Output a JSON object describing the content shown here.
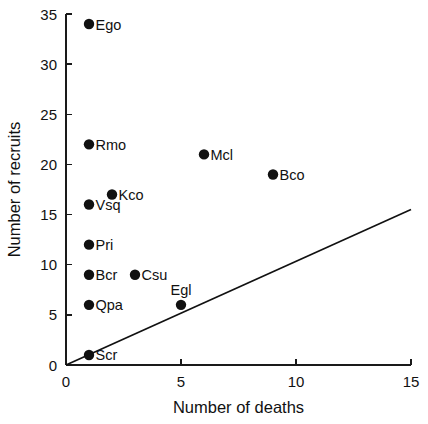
{
  "chart_data": {
    "type": "scatter",
    "title": "",
    "xlabel": "Number of deaths",
    "ylabel": "Number of recruits",
    "xlim": [
      0,
      15
    ],
    "ylim": [
      0,
      35
    ],
    "xticks": [
      0,
      5,
      10,
      15
    ],
    "yticks": [
      0,
      5,
      10,
      15,
      20,
      25,
      30,
      35
    ],
    "xtick_labels": [
      "0",
      "5",
      "10",
      "15"
    ],
    "ytick_labels": [
      "0",
      "5",
      "10",
      "15",
      "20",
      "25",
      "30",
      "35"
    ],
    "grid": false,
    "legend": "none",
    "points": [
      {
        "label": "Ego",
        "x": 1,
        "y": 34,
        "label_pos": "right"
      },
      {
        "label": "Rmo",
        "x": 1,
        "y": 22,
        "label_pos": "right"
      },
      {
        "label": "Mcl",
        "x": 6,
        "y": 21,
        "label_pos": "right"
      },
      {
        "label": "Bco",
        "x": 9,
        "y": 19,
        "label_pos": "right"
      },
      {
        "label": "Kco",
        "x": 2,
        "y": 17,
        "label_pos": "right"
      },
      {
        "label": "Vsq",
        "x": 1,
        "y": 16,
        "label_pos": "right"
      },
      {
        "label": "Pri",
        "x": 1,
        "y": 12,
        "label_pos": "right"
      },
      {
        "label": "Bcr",
        "x": 1,
        "y": 9,
        "label_pos": "right"
      },
      {
        "label": "Csu",
        "x": 3,
        "y": 9,
        "label_pos": "right"
      },
      {
        "label": "Qpa",
        "x": 1,
        "y": 6,
        "label_pos": "right"
      },
      {
        "label": "Egl",
        "x": 5,
        "y": 6,
        "label_pos": "above"
      },
      {
        "label": "Scr",
        "x": 1,
        "y": 1,
        "label_pos": "right"
      }
    ],
    "fit_line": {
      "name": "regression-line",
      "x_start": 0,
      "y_start": 0,
      "x_end": 15,
      "y_end": 15.5
    },
    "colors": {
      "marker": "#111111",
      "line": "#111111",
      "axis": "#1a1a1a",
      "background": "#ffffff"
    }
  }
}
